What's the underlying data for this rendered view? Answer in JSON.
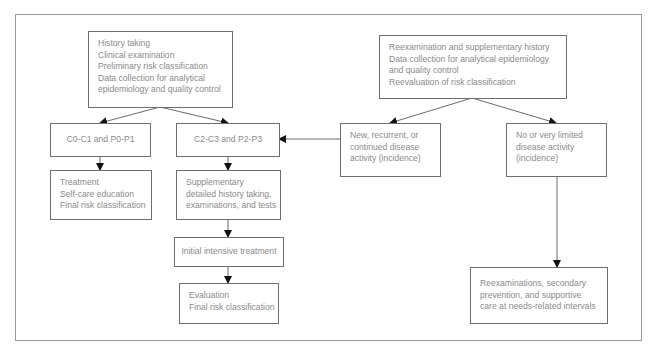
{
  "diagram": {
    "type": "flowchart",
    "nodes": {
      "initial_exam": {
        "lines": [
          "History taking",
          "Clinical examination",
          "Preliminary risk classification",
          "Data collection for analytical",
          "epidemiology and quality control"
        ]
      },
      "low_risk": {
        "lines": [
          "C0-C1 and P0-P1"
        ]
      },
      "high_risk": {
        "lines": [
          "C2-C3 and P2-P3"
        ]
      },
      "low_risk_care": {
        "lines": [
          "Treatment",
          "Self-care education",
          "Final risk classification"
        ]
      },
      "supplementary": {
        "lines": [
          "Supplementary",
          "detailed history taking,",
          "examinations, and tests"
        ]
      },
      "intensive_treatment": {
        "lines": [
          "Initial intensive treatment"
        ]
      },
      "evaluation": {
        "lines": [
          "Evaluation",
          "Final risk classification"
        ]
      },
      "reexamination": {
        "lines": [
          "Reexamination and supplementary history",
          "Data collection for analytical epidemiology",
          "and quality control",
          "Reevaluation of risk classification"
        ]
      },
      "active_disease": {
        "lines": [
          "New, recurrent, or",
          "continued disease",
          "activity (incidence)"
        ]
      },
      "limited_disease": {
        "lines": [
          "No or very limited",
          "disease activity",
          "(incidence)"
        ]
      },
      "maintenance": {
        "lines": [
          "Reexaminations, secondary",
          "prevention, and supportive",
          "care at needs-related intervals"
        ]
      }
    },
    "edges": [
      {
        "from": "initial_exam",
        "to": "low_risk"
      },
      {
        "from": "initial_exam",
        "to": "high_risk"
      },
      {
        "from": "low_risk",
        "to": "low_risk_care"
      },
      {
        "from": "high_risk",
        "to": "supplementary"
      },
      {
        "from": "supplementary",
        "to": "intensive_treatment"
      },
      {
        "from": "intensive_treatment",
        "to": "evaluation"
      },
      {
        "from": "reexamination",
        "to": "active_disease"
      },
      {
        "from": "reexamination",
        "to": "limited_disease"
      },
      {
        "from": "active_disease",
        "to": "high_risk"
      },
      {
        "from": "limited_disease",
        "to": "maintenance"
      }
    ],
    "colors": {
      "text": "#8a8a8a",
      "box_border": "#6e6e6e",
      "frame_border": "#9a9a9a",
      "arrow": "#222222"
    }
  }
}
